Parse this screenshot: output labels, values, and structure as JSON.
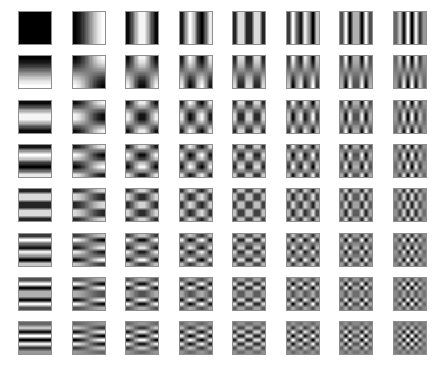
{
  "figure": {
    "type": "basis-function-grid",
    "background_color": "#ffffff",
    "tile_border_color": "#8f8f8f"
  },
  "chart_data": {
    "type": "heatmap",
    "subtitle": "",
    "xlabel": "",
    "ylabel": "",
    "grid": false,
    "legend": null,
    "colormap": "grayscale",
    "colormap_min_color": "#ffffff",
    "colormap_max_color": "#000000",
    "rows": 8,
    "cols": 8,
    "row_meaning": "vertical frequency u (0 at top, 7 at bottom)",
    "col_meaning": "horizontal frequency v (0 at left, 7 at right)",
    "block_size": 8,
    "formula": "B(u,v)[y][x] = cos((2x+1)*v*pi/16) * cos((2y+1)*u*pi/16)",
    "value_range": [
      -1,
      1
    ],
    "x": [
      0,
      1,
      2,
      3,
      4,
      5,
      6,
      7
    ],
    "y": [
      0,
      1,
      2,
      3,
      4,
      5,
      6,
      7
    ],
    "tick_labels_x": [],
    "tick_labels_y": [],
    "tiles": [
      [
        {
          "u": 0,
          "v": 0,
          "desc": "flat white (DC component)"
        },
        {
          "u": 0,
          "v": 1,
          "desc": "horizontal half-cycle, white to black"
        },
        {
          "u": 0,
          "v": 2,
          "desc": "horizontal one cycle"
        },
        {
          "u": 0,
          "v": 3,
          "desc": "horizontal 1.5 cycles"
        },
        {
          "u": 0,
          "v": 4,
          "desc": "horizontal 2 cycles"
        },
        {
          "u": 0,
          "v": 5,
          "desc": "horizontal 2.5 cycles"
        },
        {
          "u": 0,
          "v": 6,
          "desc": "horizontal 3 cycles"
        },
        {
          "u": 0,
          "v": 7,
          "desc": "horizontal 3.5 cycles"
        }
      ],
      [
        {
          "u": 1,
          "v": 0,
          "desc": "vertical half-cycle, white to black"
        },
        {
          "u": 1,
          "v": 1,
          "desc": "diagonal lobes 2x2"
        },
        {
          "u": 1,
          "v": 2,
          "desc": "mixed 1 x 2"
        },
        {
          "u": 1,
          "v": 3,
          "desc": "mixed 1 x 3"
        },
        {
          "u": 1,
          "v": 4,
          "desc": "mixed 1 x 4"
        },
        {
          "u": 1,
          "v": 5,
          "desc": "mixed 1 x 5"
        },
        {
          "u": 1,
          "v": 6,
          "desc": "mixed 1 x 6"
        },
        {
          "u": 1,
          "v": 7,
          "desc": "mixed 1 x 7"
        }
      ],
      [
        {
          "u": 2,
          "v": 0,
          "desc": "vertical one cycle"
        },
        {
          "u": 2,
          "v": 1,
          "desc": "mixed 2 x 1"
        },
        {
          "u": 2,
          "v": 2,
          "desc": "checker 2 x 2"
        },
        {
          "u": 2,
          "v": 3,
          "desc": "checker 2 x 3"
        },
        {
          "u": 2,
          "v": 4,
          "desc": "checker 2 x 4"
        },
        {
          "u": 2,
          "v": 5,
          "desc": "checker 2 x 5"
        },
        {
          "u": 2,
          "v": 6,
          "desc": "checker 2 x 6"
        },
        {
          "u": 2,
          "v": 7,
          "desc": "checker 2 x 7"
        }
      ],
      [
        {
          "u": 3,
          "v": 0,
          "desc": "vertical 1.5 cycles"
        },
        {
          "u": 3,
          "v": 1,
          "desc": "mixed 3 x 1"
        },
        {
          "u": 3,
          "v": 2,
          "desc": "checker 3 x 2"
        },
        {
          "u": 3,
          "v": 3,
          "desc": "checker 3 x 3"
        },
        {
          "u": 3,
          "v": 4,
          "desc": "checker 3 x 4"
        },
        {
          "u": 3,
          "v": 5,
          "desc": "checker 3 x 5"
        },
        {
          "u": 3,
          "v": 6,
          "desc": "checker 3 x 6"
        },
        {
          "u": 3,
          "v": 7,
          "desc": "checker 3 x 7"
        }
      ],
      [
        {
          "u": 4,
          "v": 0,
          "desc": "vertical 2 cycles"
        },
        {
          "u": 4,
          "v": 1,
          "desc": "mixed 4 x 1"
        },
        {
          "u": 4,
          "v": 2,
          "desc": "checker 4 x 2"
        },
        {
          "u": 4,
          "v": 3,
          "desc": "checker 4 x 3"
        },
        {
          "u": 4,
          "v": 4,
          "desc": "checker 4 x 4"
        },
        {
          "u": 4,
          "v": 5,
          "desc": "checker 4 x 5"
        },
        {
          "u": 4,
          "v": 6,
          "desc": "checker 4 x 6"
        },
        {
          "u": 4,
          "v": 7,
          "desc": "checker 4 x 7"
        }
      ],
      [
        {
          "u": 5,
          "v": 0,
          "desc": "vertical 2.5 cycles"
        },
        {
          "u": 5,
          "v": 1,
          "desc": "mixed 5 x 1"
        },
        {
          "u": 5,
          "v": 2,
          "desc": "checker 5 x 2"
        },
        {
          "u": 5,
          "v": 3,
          "desc": "checker 5 x 3"
        },
        {
          "u": 5,
          "v": 4,
          "desc": "checker 5 x 4"
        },
        {
          "u": 5,
          "v": 5,
          "desc": "checker 5 x 5"
        },
        {
          "u": 5,
          "v": 6,
          "desc": "checker 5 x 6"
        },
        {
          "u": 5,
          "v": 7,
          "desc": "checker 5 x 7"
        }
      ],
      [
        {
          "u": 6,
          "v": 0,
          "desc": "vertical 3 cycles"
        },
        {
          "u": 6,
          "v": 1,
          "desc": "mixed 6 x 1"
        },
        {
          "u": 6,
          "v": 2,
          "desc": "checker 6 x 2"
        },
        {
          "u": 6,
          "v": 3,
          "desc": "checker 6 x 3"
        },
        {
          "u": 6,
          "v": 4,
          "desc": "checker 6 x 4"
        },
        {
          "u": 6,
          "v": 5,
          "desc": "checker 6 x 5"
        },
        {
          "u": 6,
          "v": 6,
          "desc": "checker 6 x 6"
        },
        {
          "u": 6,
          "v": 7,
          "desc": "checker 6 x 7"
        }
      ],
      [
        {
          "u": 7,
          "v": 0,
          "desc": "vertical 3.5 cycles"
        },
        {
          "u": 7,
          "v": 1,
          "desc": "mixed 7 x 1"
        },
        {
          "u": 7,
          "v": 2,
          "desc": "checker 7 x 2"
        },
        {
          "u": 7,
          "v": 3,
          "desc": "checker 7 x 3"
        },
        {
          "u": 7,
          "v": 4,
          "desc": "checker 7 x 4"
        },
        {
          "u": 7,
          "v": 5,
          "desc": "checker 7 x 5"
        },
        {
          "u": 7,
          "v": 6,
          "desc": "checker 7 x 6"
        },
        {
          "u": 7,
          "v": 7,
          "desc": "finest checker 7 x 7"
        }
      ]
    ],
    "layout": {
      "grid_left": 18,
      "grid_top": 11,
      "col_pitch": 53.5,
      "row_pitch": 44.3,
      "tile_size": 34
    }
  }
}
